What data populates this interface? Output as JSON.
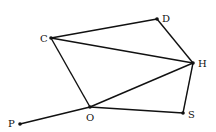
{
  "diagram": {
    "type": "graph",
    "nodes": [
      {
        "id": "C",
        "label": "C",
        "x": 51,
        "y": 38,
        "lx": 40,
        "ly": 42
      },
      {
        "id": "D",
        "label": "D",
        "x": 157,
        "y": 19,
        "lx": 162,
        "ly": 22
      },
      {
        "id": "H",
        "label": "H",
        "x": 193,
        "y": 63,
        "lx": 198,
        "ly": 67
      },
      {
        "id": "S",
        "label": "S",
        "x": 183,
        "y": 113,
        "lx": 188,
        "ly": 118
      },
      {
        "id": "O",
        "label": "O",
        "x": 90,
        "y": 107,
        "lx": 86,
        "ly": 121
      },
      {
        "id": "P",
        "label": "P",
        "x": 20,
        "y": 124,
        "lx": 8,
        "ly": 127
      }
    ],
    "edges": [
      [
        "C",
        "D"
      ],
      [
        "D",
        "H"
      ],
      [
        "C",
        "H"
      ],
      [
        "C",
        "O"
      ],
      [
        "O",
        "H"
      ],
      [
        "H",
        "S"
      ],
      [
        "O",
        "S"
      ],
      [
        "P",
        "O"
      ]
    ],
    "stroke_color": "#111111"
  }
}
